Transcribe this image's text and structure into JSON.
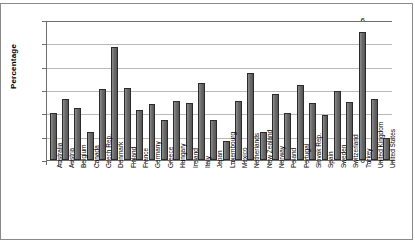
{
  "chart_data": {
    "type": "bar",
    "title": "",
    "xlabel": "",
    "ylabel": "Percentage",
    "ylim": [
      0,
      6
    ],
    "ytick_labels": [
      "0",
      "1",
      "2",
      "3",
      "4",
      "5",
      "6"
    ],
    "grid": true,
    "legend": "none",
    "categories": [
      "Australia",
      "Austria",
      "Belgium",
      "Canada",
      "Czech Rep.",
      "Denmark",
      "Finland",
      "France",
      "Germany",
      "Greece",
      "Hungary",
      "Ireland",
      "Italy",
      "Japan",
      "Luxembourg",
      "Mexico",
      "Netherlands",
      "New Zealand",
      "Norway",
      "Poland",
      "Portugal",
      "Slovak Rep.",
      "Spain",
      "Sweden",
      "Switzerland",
      "Turkey",
      "United Kingdom",
      "United States"
    ],
    "values": [
      2.0,
      2.6,
      2.25,
      1.2,
      3.05,
      4.85,
      3.1,
      2.15,
      2.4,
      1.7,
      2.55,
      2.45,
      3.3,
      1.7,
      0.8,
      2.55,
      3.75,
      1.2,
      2.85,
      2.0,
      3.2,
      2.45,
      1.95,
      2.95,
      2.5,
      5.5,
      2.6,
      0.95
    ],
    "bar_color": "#6a6a6a",
    "bar_edge_color": "#2b2b2b",
    "grid_color": "#b9b9b9",
    "axis_color": "#6e6e6e"
  }
}
